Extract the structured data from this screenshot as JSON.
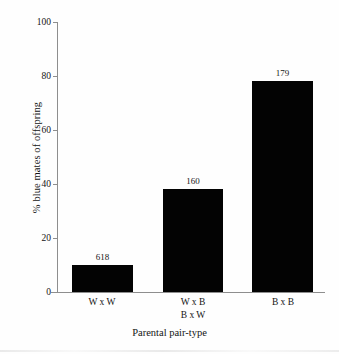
{
  "chart_data": {
    "type": "bar",
    "title": "",
    "subtitle": "",
    "xlabel": "Parental pair-type",
    "ylabel": "% blue mates of offspring",
    "categories": [
      "W x W",
      "W x B\nB x W",
      "B x B"
    ],
    "category_lines": [
      [
        "W x W"
      ],
      [
        "W x B",
        "B x W"
      ],
      [
        "B x B"
      ]
    ],
    "values": [
      10,
      38,
      78
    ],
    "point_labels": [
      "618",
      "160",
      "179"
    ],
    "point_label_meaning": "sample size above each bar",
    "ylim": [
      0,
      100
    ],
    "yticks": [
      0,
      20,
      40,
      60,
      80,
      100
    ],
    "ytick_labels": [
      "0",
      "20",
      "40",
      "60",
      "80",
      "100"
    ],
    "grid": false,
    "legend": false,
    "legend_position": "none",
    "bar_color": "#030303",
    "axis_color": "#8e8e8e",
    "background_color": "#fefefe",
    "text_color": "#141414"
  }
}
